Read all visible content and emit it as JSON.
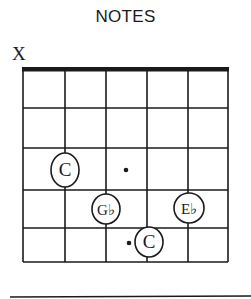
{
  "title": "NOTES",
  "open_muted": [
    {
      "string": 1,
      "marker": "X"
    }
  ],
  "diagram": {
    "strings": 6,
    "frets": 5,
    "nut": true,
    "grid_x": [
      23,
      65,
      106,
      147,
      188,
      228
    ],
    "grid_y": [
      70,
      108,
      148,
      190,
      228,
      262
    ],
    "line_color": "#1a1a1a"
  },
  "notes": [
    {
      "label": "C",
      "string": 2,
      "fret": 3,
      "cx": 65,
      "cy": 170,
      "rx": 14,
      "ry": 17
    },
    {
      "label": "G♭",
      "string": 3,
      "fret": 4,
      "cx": 106,
      "cy": 209,
      "rx": 14,
      "ry": 15
    },
    {
      "label": "E♭",
      "string": 5,
      "fret": 4,
      "cx": 189,
      "cy": 208,
      "rx": 15,
      "ry": 15
    },
    {
      "label": "C",
      "string": 4,
      "fret": 5,
      "cx": 149,
      "cy": 242,
      "rx": 14,
      "ry": 15
    }
  ],
  "dots": [
    {
      "cx": 126,
      "cy": 170
    },
    {
      "cx": 129,
      "cy": 243
    }
  ]
}
